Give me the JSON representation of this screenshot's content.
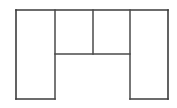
{
  "diagram": {
    "shape_name": "inverted-u-floor-plan",
    "background_color": "#ffffff",
    "stroke_color": "#3b3b3b",
    "inner_stroke_color": "#4a4a4a",
    "stroke_width": 1.6,
    "canvas": {
      "width": 177,
      "height": 108
    },
    "bounds": {
      "left": 16,
      "top": 10,
      "right": 168,
      "bottom": 99
    },
    "guides": {
      "x_left_edge": 16,
      "x_divider_1": 55,
      "x_divider_2": 93,
      "x_divider_3": 130,
      "x_right_edge": 168,
      "y_top_edge": 10,
      "y_mid_divider": 54,
      "y_bottom_edge": 99
    },
    "regions": [
      {
        "name": "left-column-region",
        "label": "",
        "x": 16,
        "y": 10,
        "width": 39,
        "height": 89
      },
      {
        "name": "top-center-left-region",
        "label": "",
        "x": 55,
        "y": 10,
        "width": 38,
        "height": 44
      },
      {
        "name": "top-center-right-region",
        "label": "",
        "x": 93,
        "y": 10,
        "width": 37,
        "height": 44
      },
      {
        "name": "right-column-region",
        "label": "",
        "x": 130,
        "y": 10,
        "width": 38,
        "height": 89
      }
    ],
    "segments": [
      {
        "name": "outer-top-edge",
        "x1": 16,
        "y1": 10,
        "x2": 168,
        "y2": 10,
        "kind": "outer"
      },
      {
        "name": "outer-left-edge",
        "x1": 16,
        "y1": 10,
        "x2": 16,
        "y2": 99,
        "kind": "outer"
      },
      {
        "name": "outer-right-edge",
        "x1": 168,
        "y1": 10,
        "x2": 168,
        "y2": 99,
        "kind": "outer"
      },
      {
        "name": "left-column-bottom",
        "x1": 16,
        "y1": 99,
        "x2": 55,
        "y2": 99,
        "kind": "outer"
      },
      {
        "name": "right-column-bottom",
        "x1": 130,
        "y1": 99,
        "x2": 168,
        "y2": 99,
        "kind": "outer"
      },
      {
        "name": "left-column-divider",
        "x1": 55,
        "y1": 10,
        "x2": 55,
        "y2": 99,
        "kind": "inner"
      },
      {
        "name": "center-divider",
        "x1": 93,
        "y1": 10,
        "x2": 93,
        "y2": 54,
        "kind": "inner"
      },
      {
        "name": "right-column-divider",
        "x1": 130,
        "y1": 10,
        "x2": 130,
        "y2": 99,
        "kind": "inner"
      },
      {
        "name": "center-bottom-divider",
        "x1": 55,
        "y1": 54,
        "x2": 130,
        "y2": 54,
        "kind": "inner"
      }
    ]
  }
}
